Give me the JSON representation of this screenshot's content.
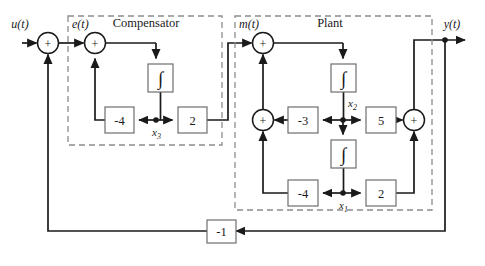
{
  "figure": {
    "type": "block-diagram",
    "domain": "control-systems",
    "background": "#ffffff",
    "line_color": "#1a1a1a",
    "dash_color": "#8c8c8c",
    "box_stroke": "#6e6e6e"
  },
  "groups": [
    {
      "id": "compensator",
      "title": "Compensator",
      "x": 68,
      "y": 16,
      "w": 154,
      "h": 129
    },
    {
      "id": "plant",
      "title": "Plant",
      "x": 235,
      "y": 16,
      "w": 197,
      "h": 194
    }
  ],
  "signals": {
    "input": "u(t)",
    "error": "e(t)",
    "control": "m(t)",
    "output": "y(t)",
    "state_compensator": "x3",
    "state_plant_upper": "x2",
    "state_plant_lower": "x1"
  },
  "state_labels": {
    "x3": {
      "base": "x",
      "sub": "3"
    },
    "x2": {
      "base": "x",
      "sub": "2"
    },
    "x1": {
      "base": "x",
      "sub": "1"
    }
  },
  "summers": [
    {
      "id": "sum-input",
      "cx": 48,
      "cy": 43,
      "r": 10,
      "sign": "+"
    },
    {
      "id": "sum-error",
      "cx": 95,
      "cy": 43,
      "r": 10,
      "sign": "+"
    },
    {
      "id": "sum-control",
      "cx": 263,
      "cy": 43,
      "r": 10,
      "sign": "+"
    },
    {
      "id": "sum-plant-mid",
      "cx": 263,
      "cy": 120,
      "r": 10,
      "sign": "+"
    },
    {
      "id": "sum-output",
      "cx": 414,
      "cy": 120,
      "r": 10,
      "sign": "+"
    }
  ],
  "gains": [
    {
      "id": "gain-comp-neg4",
      "value": "-4",
      "x": 105,
      "y": 107,
      "w": 29,
      "h": 26
    },
    {
      "id": "gain-comp-2",
      "value": "2",
      "x": 178,
      "y": 107,
      "w": 29,
      "h": 26
    },
    {
      "id": "gain-plant-neg3",
      "value": "-3",
      "x": 288,
      "y": 107,
      "w": 30,
      "h": 26
    },
    {
      "id": "gain-plant-5",
      "value": "5",
      "x": 366,
      "y": 107,
      "w": 30,
      "h": 26
    },
    {
      "id": "gain-plant-neg4",
      "value": "-4",
      "x": 288,
      "y": 180,
      "w": 30,
      "h": 26
    },
    {
      "id": "gain-plant-2",
      "value": "2",
      "x": 366,
      "y": 180,
      "w": 30,
      "h": 26
    },
    {
      "id": "gain-feedback",
      "value": "-1",
      "x": 207,
      "y": 220,
      "w": 29,
      "h": 23
    }
  ],
  "integrators": [
    {
      "id": "integrator-comp",
      "glyph": "integral",
      "x": 148,
      "y": 64,
      "w": 25,
      "h": 28
    },
    {
      "id": "integrator-plant-x2",
      "glyph": "integral",
      "x": 331,
      "y": 64,
      "w": 25,
      "h": 28
    },
    {
      "id": "integrator-plant-x1",
      "glyph": "integral",
      "x": 331,
      "y": 140,
      "w": 25,
      "h": 28
    }
  ],
  "nodes": [
    {
      "id": "node-x3",
      "cx": 156,
      "cy": 120
    },
    {
      "id": "node-x2",
      "cx": 343,
      "cy": 120
    },
    {
      "id": "node-x1",
      "cx": 343,
      "cy": 193
    },
    {
      "id": "node-y",
      "cx": 445,
      "cy": 40
    }
  ],
  "integral_glyph": "∫"
}
